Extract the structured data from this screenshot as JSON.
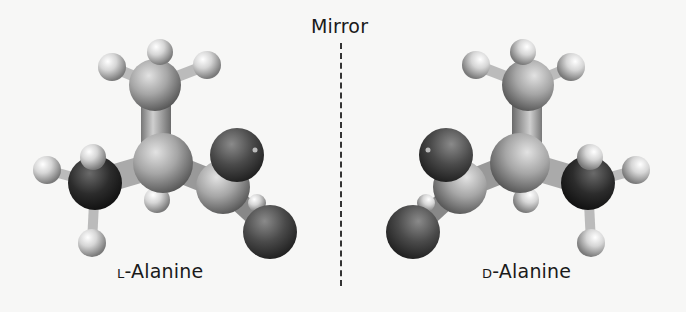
{
  "figure": {
    "mirror_label": "Mirror",
    "left_molecule": {
      "prefix": "l",
      "name": "-Alanine"
    },
    "right_molecule": {
      "prefix": "d",
      "name": "-Alanine"
    }
  },
  "colors": {
    "background": "#f7f7f6",
    "carbon": "#9a9a9a",
    "hydrogen": "#d8d8d8",
    "nitrogen": "#2a2a2a",
    "oxygen": "#4a4a4a",
    "text": "#1a1a1a"
  }
}
